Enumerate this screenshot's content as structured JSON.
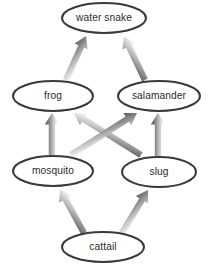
{
  "diagram": {
    "type": "food-web-energy-flow",
    "background_color": "#ffffff",
    "node_stroke_color": "#3a3a3a",
    "node_fill_color": "#ffffff",
    "label_color": "#2b2b2b",
    "arrow_head_color": "#4a4a4a",
    "arrow_tail_color": "#e8e8e8",
    "nodes": [
      {
        "id": "water_snake",
        "label": "water snake",
        "cx": 104,
        "cy": 18,
        "rx": 42,
        "ry": 15,
        "trophic_level": 4
      },
      {
        "id": "frog",
        "label": "frog",
        "cx": 53,
        "cy": 96,
        "rx": 40,
        "ry": 15,
        "trophic_level": 3
      },
      {
        "id": "salamander",
        "label": "salamander",
        "cx": 159,
        "cy": 96,
        "rx": 41,
        "ry": 15,
        "trophic_level": 3
      },
      {
        "id": "mosquito",
        "label": "mosquito",
        "cx": 53,
        "cy": 171,
        "rx": 40,
        "ry": 15,
        "trophic_level": 2
      },
      {
        "id": "slug",
        "label": "slug",
        "cx": 159,
        "cy": 172,
        "rx": 37,
        "ry": 15,
        "trophic_level": 2
      },
      {
        "id": "cattail",
        "label": "cattail",
        "cx": 103,
        "cy": 247,
        "rx": 41,
        "ry": 15,
        "trophic_level": 1
      }
    ],
    "arrows": [
      {
        "id": "frog_to_water_snake",
        "from": "frog",
        "to": "water_snake",
        "x1": 66,
        "y1": 80,
        "x2": 86,
        "y2": 36
      },
      {
        "id": "salamander_to_water_snake",
        "from": "salamander",
        "to": "water_snake",
        "x1": 145,
        "y1": 80,
        "x2": 124,
        "y2": 36
      },
      {
        "id": "mosquito_to_frog",
        "from": "mosquito",
        "to": "frog",
        "x1": 52,
        "y1": 155,
        "x2": 52,
        "y2": 113
      },
      {
        "id": "slug_to_salamander",
        "from": "slug",
        "to": "salamander",
        "x1": 158,
        "y1": 156,
        "x2": 158,
        "y2": 113
      },
      {
        "id": "slug_to_frog",
        "from": "slug",
        "to": "frog",
        "x1": 141,
        "y1": 155,
        "x2": 74,
        "y2": 113
      },
      {
        "id": "mosquito_to_salamander",
        "from": "mosquito",
        "to": "salamander",
        "x1": 71,
        "y1": 155,
        "x2": 137,
        "y2": 113
      },
      {
        "id": "cattail_to_mosquito",
        "from": "cattail",
        "to": "mosquito",
        "x1": 84,
        "y1": 233,
        "x2": 60,
        "y2": 189
      },
      {
        "id": "cattail_to_slug",
        "from": "cattail",
        "to": "slug",
        "x1": 122,
        "y1": 233,
        "x2": 148,
        "y2": 190
      }
    ]
  }
}
